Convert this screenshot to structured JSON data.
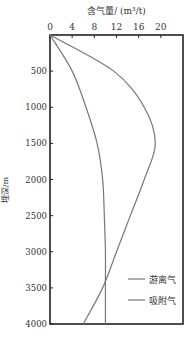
{
  "chart_data": {
    "type": "line",
    "title": "",
    "xlabel": "含气量/ (m³/t)",
    "ylabel": "埋深/m",
    "x_ticks": [
      0,
      4,
      8,
      12,
      16,
      20
    ],
    "y_ticks": [
      500,
      1000,
      1500,
      2000,
      2500,
      3000,
      3500,
      4000
    ],
    "xlim": [
      0,
      24
    ],
    "ylim": [
      0,
      4000
    ],
    "y_inverted": true,
    "x_axis_position": "top",
    "grid": false,
    "legend_position": "lower right",
    "depth": [
      0,
      500,
      1000,
      1500,
      2000,
      2500,
      3000,
      3500,
      4000
    ],
    "series": [
      {
        "name": "游离气",
        "values": [
          0,
          4,
          6.5,
          8.5,
          9.5,
          9.8,
          10,
          10,
          10
        ]
      },
      {
        "name": "吸附气",
        "values": [
          0,
          11.5,
          17,
          19,
          17,
          14.5,
          12,
          9.5,
          6
        ]
      }
    ]
  }
}
